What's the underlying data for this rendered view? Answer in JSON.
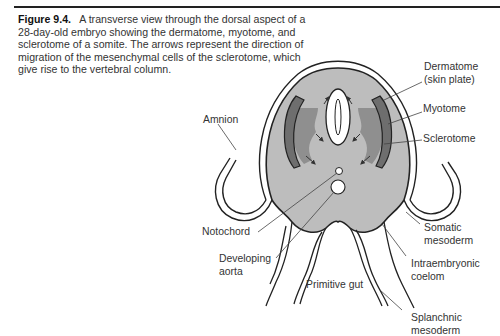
{
  "figure": {
    "label": "Figure 9.4.",
    "caption": "A transverse view through the dorsal aspect of a 28-day-old embryo showing the dermatome, myotome, and sclerotome of a somite. The arrows represent the direction of migration of the mesenchymal cells of the sclerotome, which give rise to the vertebral column."
  },
  "labels": {
    "dermatome_1": "Dermatome",
    "dermatome_2": "(skin plate)",
    "myotome": "Myotome",
    "sclerotome": "Sclerotome",
    "amnion": "Amnion",
    "notochord": "Notochord",
    "developing_aorta_1": "Developing",
    "developing_aorta_2": "aorta",
    "primitive_gut": "Primitive gut",
    "somatic_mesoderm_1": "Somatic",
    "somatic_mesoderm_2": "mesoderm",
    "intraembryonic_coelom_1": "Intraembryonic",
    "intraembryonic_coelom_2": "coelom",
    "splanchnic_mesoderm_1": "Splanchnic",
    "splanchnic_mesoderm_2": "mesoderm"
  },
  "colors": {
    "body_fill": "#bdbdbd",
    "somite_dark": "#6e6e6e",
    "sclerotome": "#8f8f8f",
    "line": "#222222"
  }
}
